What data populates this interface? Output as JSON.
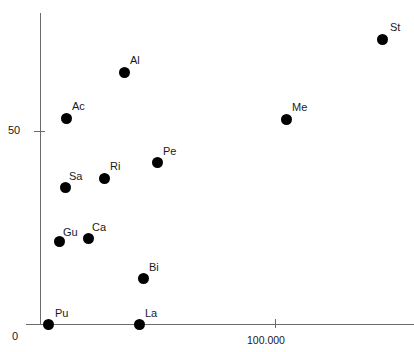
{
  "chart_data": {
    "type": "scatter",
    "title": "",
    "xlabel": "",
    "ylabel": "",
    "grid": false,
    "legend": false,
    "xticks": [
      {
        "label": "100.000",
        "px": 275
      }
    ],
    "yticks": [
      {
        "label": "50",
        "px": 131
      },
      {
        "label": "0",
        "px": 324
      }
    ],
    "x_axis_origin_label": "0",
    "points": [
      {
        "label": "St",
        "px": 382,
        "py": 39,
        "lx": 390,
        "ly": 22
      },
      {
        "label": "Al",
        "px": 124,
        "py": 72,
        "lx": 130,
        "ly": 55
      },
      {
        "label": "Ac",
        "px": 66,
        "py": 118,
        "lx": 72,
        "ly": 101
      },
      {
        "label": "Me",
        "px": 286,
        "py": 119,
        "lx": 292,
        "ly": 102
      },
      {
        "label": "Pe",
        "px": 157,
        "py": 162,
        "lx": 163,
        "ly": 146
      },
      {
        "label": "Ri",
        "px": 104,
        "py": 178,
        "lx": 110,
        "ly": 161
      },
      {
        "label": "Sa",
        "px": 65,
        "py": 187,
        "lx": 69,
        "ly": 171
      },
      {
        "label": "Ca",
        "px": 88,
        "py": 238,
        "lx": 92,
        "ly": 222
      },
      {
        "label": "Gu",
        "px": 59,
        "py": 241,
        "lx": 63,
        "ly": 227
      },
      {
        "label": "Bi",
        "px": 143,
        "py": 278,
        "lx": 149,
        "ly": 262
      },
      {
        "label": "La",
        "px": 139,
        "py": 324,
        "lx": 145,
        "ly": 308
      },
      {
        "label": "Pu",
        "px": 48,
        "py": 324,
        "lx": 55,
        "ly": 308
      }
    ]
  }
}
